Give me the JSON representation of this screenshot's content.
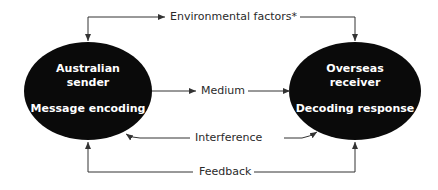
{
  "diagram": {
    "type": "communication-model",
    "colors": {
      "node_fill": "#0a0a0a",
      "node_text": "#ffffff",
      "line": "#333333",
      "label": "#2a2a2a"
    },
    "nodes": [
      {
        "id": "sender",
        "title_line1": "Australian",
        "title_line2": "sender",
        "subtitle": "Message encoding"
      },
      {
        "id": "receiver",
        "title_line1": "Overseas",
        "title_line2": "receiver",
        "subtitle": "Decoding response"
      }
    ],
    "edges": {
      "environmental": {
        "label": "Environmental factors*",
        "direction": "to-both-nodes"
      },
      "medium": {
        "label": "Medium",
        "direction": "sender-to-receiver"
      },
      "interference": {
        "label": "Interference",
        "direction": "to-both-nodes"
      },
      "feedback": {
        "label": "Feedback",
        "direction": "to-both-nodes"
      }
    }
  }
}
